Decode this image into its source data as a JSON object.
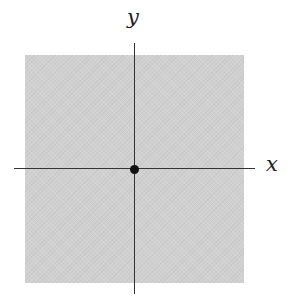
{
  "diagram": {
    "labels": {
      "x_axis": "x",
      "y_axis": "y"
    },
    "region": {
      "shape": "square",
      "fill": "#d0d0d0"
    },
    "origin": {
      "marker": "filled-dot",
      "color": "#111111"
    },
    "axis_color": "#333333"
  }
}
